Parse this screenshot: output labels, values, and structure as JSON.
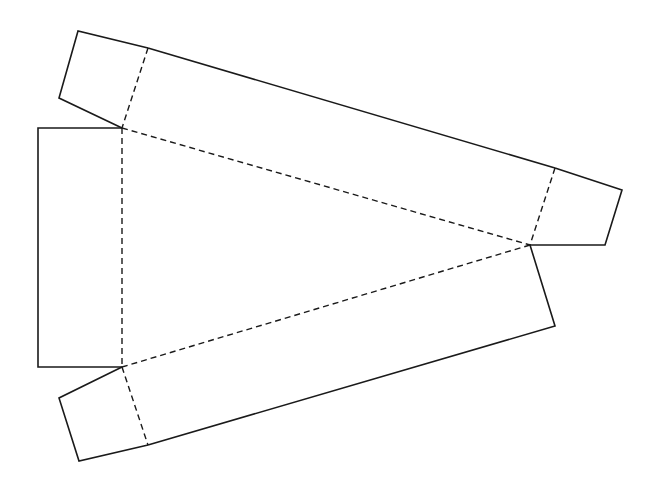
{
  "diagram": {
    "width": 654,
    "height": 497,
    "colors": {
      "background": "#ffffff",
      "line": "#1a1a1a"
    },
    "cut_lines": [
      {
        "name": "top-left-flap",
        "points": [
          [
            122,
            128
          ],
          [
            59,
            98
          ],
          [
            78,
            31
          ],
          [
            148,
            48
          ]
        ]
      },
      {
        "name": "top-rect-outer-edge",
        "points": [
          [
            148,
            48
          ],
          [
            555,
            168
          ]
        ]
      },
      {
        "name": "right-flap",
        "points": [
          [
            555,
            168
          ],
          [
            622,
            190
          ],
          [
            605,
            245
          ],
          [
            530,
            245
          ]
        ]
      },
      {
        "name": "bottom-rect-right-edge",
        "points": [
          [
            530,
            245
          ],
          [
            555,
            326
          ],
          [
            148,
            445
          ]
        ]
      },
      {
        "name": "bottom-left-flap",
        "points": [
          [
            148,
            445
          ],
          [
            79,
            461
          ],
          [
            59,
            398
          ],
          [
            122,
            367
          ]
        ]
      },
      {
        "name": "left-rect",
        "points": [
          [
            122,
            367
          ],
          [
            38,
            367
          ],
          [
            38,
            128
          ],
          [
            122,
            128
          ]
        ]
      }
    ],
    "fold_lines": [
      {
        "name": "top-flap-fold",
        "points": [
          [
            148,
            48
          ],
          [
            122,
            128
          ]
        ]
      },
      {
        "name": "triangle-top-edge",
        "points": [
          [
            122,
            128
          ],
          [
            530,
            245
          ]
        ]
      },
      {
        "name": "right-flap-fold",
        "points": [
          [
            555,
            168
          ],
          [
            530,
            245
          ]
        ]
      },
      {
        "name": "triangle-bottom-edge",
        "points": [
          [
            530,
            245
          ],
          [
            122,
            367
          ]
        ]
      },
      {
        "name": "triangle-left-edge",
        "points": [
          [
            122,
            128
          ],
          [
            122,
            367
          ]
        ]
      },
      {
        "name": "bottom-flap-fold",
        "points": [
          [
            122,
            367
          ],
          [
            148,
            445
          ]
        ]
      }
    ]
  }
}
